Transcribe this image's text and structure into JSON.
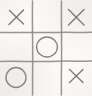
{
  "image": {
    "title": "Tic-Tac-Toe Board",
    "width": 92,
    "height": 96,
    "background_color": "#fbfaf8",
    "line_color": "#8e8c89",
    "mark_color": "#6f6d6a",
    "style": "hand-drawn pencil on paper, scanned"
  },
  "game": {
    "name": "Tic-Tac-Toe",
    "rows": 3,
    "columns": 3,
    "x_symbol": "X",
    "o_symbol": "O",
    "empty_symbol": "",
    "board": [
      [
        "X",
        "",
        "X"
      ],
      [
        "",
        "O",
        ""
      ],
      [
        "O",
        "",
        "X"
      ]
    ],
    "cells": [
      {
        "id": "cell-0-0",
        "row": 0,
        "col": 0,
        "name": "top-left",
        "mark": "X"
      },
      {
        "id": "cell-0-1",
        "row": 0,
        "col": 1,
        "name": "top-center",
        "mark": ""
      },
      {
        "id": "cell-0-2",
        "row": 0,
        "col": 2,
        "name": "top-right",
        "mark": "X"
      },
      {
        "id": "cell-1-0",
        "row": 1,
        "col": 0,
        "name": "middle-left",
        "mark": ""
      },
      {
        "id": "cell-1-1",
        "row": 1,
        "col": 1,
        "name": "middle-center",
        "mark": "O"
      },
      {
        "id": "cell-1-2",
        "row": 1,
        "col": 2,
        "name": "middle-right",
        "mark": ""
      },
      {
        "id": "cell-2-0",
        "row": 2,
        "col": 0,
        "name": "bottom-left",
        "mark": "O"
      },
      {
        "id": "cell-2-1",
        "row": 2,
        "col": 1,
        "name": "bottom-center",
        "mark": ""
      },
      {
        "id": "cell-2-2",
        "row": 2,
        "col": 2,
        "name": "bottom-right",
        "mark": "X"
      }
    ],
    "counts": {
      "x": 3,
      "o": 2,
      "empty": 4
    },
    "grid": {
      "vertical_lines_x": [
        32,
        61
      ],
      "horizontal_lines_y": [
        32,
        61
      ]
    }
  }
}
